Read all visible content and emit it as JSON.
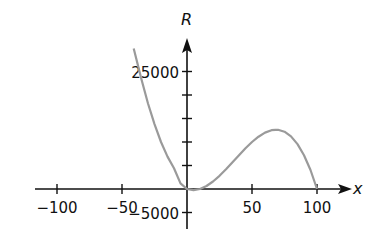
{
  "chart_data": {
    "type": "line",
    "title": "",
    "xlabel": "x",
    "ylabel": "R",
    "xlim": [
      -120,
      110
    ],
    "ylim": [
      -7000,
      32000
    ],
    "grid": false,
    "legend": null,
    "x_ticks": [
      -100,
      -50,
      50,
      100
    ],
    "x_tick_labels": [
      "−100",
      "−50",
      "50",
      "100"
    ],
    "y_ticks": [
      -5000,
      5000,
      10000,
      15000,
      20000,
      25000
    ],
    "y_tick_labels": [
      {
        "value": 25000,
        "label": "25000"
      },
      {
        "value": -5000,
        "label": "−5000"
      }
    ],
    "series": [
      {
        "name": "R(x)",
        "color": "#9a9a9a",
        "x": [
          -41,
          -35,
          -30,
          -25,
          -20,
          -15,
          -10,
          -5,
          0,
          5,
          10,
          15,
          20,
          25,
          30,
          35,
          40,
          45,
          50,
          55,
          60,
          65,
          68,
          70,
          75,
          80,
          85,
          90,
          95,
          100
        ],
        "values": [
          29900,
          23300,
          18200,
          13800,
          10000,
          6900,
          4400,
          1200,
          0,
          -238,
          0,
          638,
          1600,
          2813,
          4200,
          5688,
          7200,
          8663,
          10000,
          11138,
          12000,
          12513,
          12580,
          12600,
          12188,
          11200,
          9563,
          7200,
          4038,
          0
        ]
      }
    ],
    "colors": {
      "axis": "#111111",
      "curve": "#9a9a9a",
      "background": "#ffffff"
    }
  }
}
